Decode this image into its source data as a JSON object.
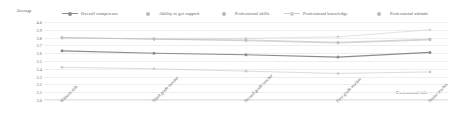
{
  "chart_data": {
    "type": "line",
    "title": "",
    "subtitle": "",
    "xlabel": "Professional title",
    "ylabel": "Average",
    "ylim": [
      3.0,
      4.0
    ],
    "grid": true,
    "legend_position": "top",
    "categories": [
      "Without title",
      "Third grade teacher",
      "Second grade teacher",
      "First grade teacher",
      "Senior teacher"
    ],
    "yticks": [
      "4.0",
      "3.9",
      "3.8",
      "3.7",
      "3.6",
      "3.5",
      "3.4",
      "3.3",
      "3.2",
      "3.1",
      "3.0"
    ],
    "ytick_values": [
      4.0,
      3.9,
      3.8,
      3.7,
      3.6,
      3.5,
      3.4,
      3.3,
      3.2,
      3.1,
      3.0
    ],
    "series": [
      {
        "name": "Overall competence",
        "color": "#8c8c8e",
        "values": [
          3.63,
          3.6,
          3.58,
          3.55,
          3.61
        ]
      },
      {
        "name": "Ability to get support",
        "color": "#c8c8ca",
        "values": [
          3.42,
          3.4,
          3.37,
          3.34,
          3.36
        ]
      },
      {
        "name": "Professional skills",
        "color": "#c0c0c2",
        "values": [
          3.8,
          3.78,
          3.76,
          3.73,
          3.77
        ]
      },
      {
        "name": "Professional knowledge",
        "color": "#d4d4d6",
        "values": [
          3.79,
          3.79,
          3.79,
          3.81,
          3.9
        ]
      },
      {
        "name": "Professional attitude",
        "color": "#bdbdbf",
        "values": [
          3.8,
          3.78,
          3.77,
          3.74,
          3.78
        ]
      }
    ]
  },
  "legend": {
    "items": [
      {
        "label": "Overall competence",
        "color": "#8c8c8e",
        "mark": "line-marker",
        "left": 62,
        "has_line": true
      },
      {
        "label": "Ability to get support",
        "color": "#b9b9bb",
        "mark": "dot-marker",
        "left": 140,
        "has_line": false
      },
      {
        "label": "Professional skills",
        "color": "#b9b9bb",
        "mark": "dot-marker",
        "left": 216,
        "has_line": false
      },
      {
        "label": "Professional knowledge",
        "color": "#cfcfd1",
        "mark": "dash-marker",
        "left": 284,
        "has_line": true
      },
      {
        "label": "Professional attitude",
        "color": "#b9b9bb",
        "mark": "dot-marker",
        "left": 371,
        "has_line": false
      }
    ]
  },
  "axes": {
    "y_title": "Average",
    "x_title": "Professional title"
  }
}
